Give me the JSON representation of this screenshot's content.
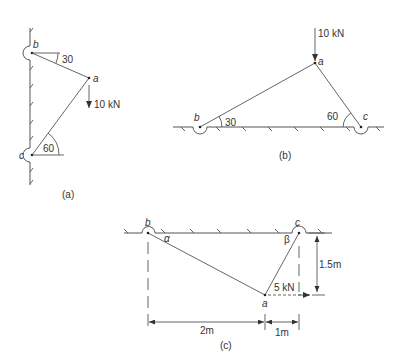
{
  "figures": {
    "a": {
      "caption": "(a)",
      "nodes": {
        "b": "b",
        "a": "a",
        "c": "c"
      },
      "angle_b": "30",
      "angle_c": "60",
      "load": "10 kN"
    },
    "b": {
      "caption": "(b)",
      "nodes": {
        "b": "b",
        "a": "a",
        "c": "c"
      },
      "angle_b": "30",
      "angle_c": "60",
      "load": "10 kN"
    },
    "c": {
      "caption": "(c)",
      "nodes": {
        "b": "b",
        "a": "a",
        "c": "c"
      },
      "angle_alpha": "α",
      "angle_beta": "β",
      "load": "5 kN",
      "dim_vertical": "1.5m",
      "dim_horizontal_1": "2m",
      "dim_horizontal_2": "1m"
    }
  },
  "colors": {
    "line": "#555555",
    "text": "#333333",
    "background": "#ffffff"
  }
}
